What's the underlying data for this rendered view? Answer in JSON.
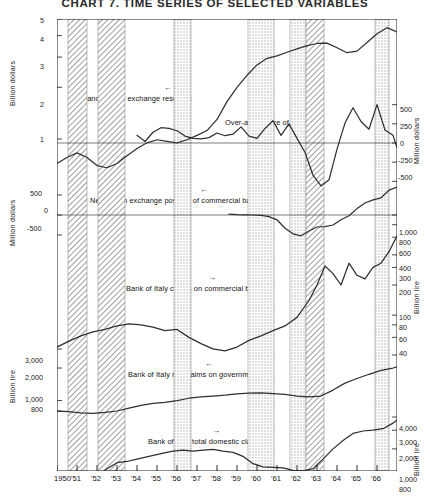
{
  "title": "CHART 7.  TIME SERIES OF SELECTED VARIABLES",
  "chart_data": {
    "type": "line",
    "title": "CHART 7.  TIME SERIES OF SELECTED VARIABLES",
    "subtitle": "Italy, monetary and balance-of-payments variables, 1950-1966",
    "xlabel": "",
    "grid": false,
    "legend_position": "inline-annotations",
    "x_axis": {
      "start_year": 1950,
      "end_year": 1967,
      "tick_labels": [
        "1950",
        "'51",
        "'52",
        "'53",
        "'54",
        "'55",
        "'56",
        "'57",
        "'58",
        "'59",
        "'60",
        "'61",
        "'62",
        "'63",
        "'64",
        "'65",
        "'66"
      ],
      "tick_years": [
        1950,
        1951,
        1952,
        1953,
        1954,
        1955,
        1956,
        1957,
        1958,
        1959,
        1960,
        1961,
        1962,
        1963,
        1964,
        1965,
        1966
      ]
    },
    "shaded_bands": [
      {
        "start": 1950.55,
        "end": 1951.5,
        "pattern": "hatch"
      },
      {
        "start": 1952.05,
        "end": 1953.4,
        "pattern": "hatch"
      },
      {
        "start": 1955.85,
        "end": 1956.7,
        "pattern": "dots"
      },
      {
        "start": 1959.55,
        "end": 1960.85,
        "pattern": "dots"
      },
      {
        "start": 1961.65,
        "end": 1962.45,
        "pattern": "dots"
      },
      {
        "start": 1962.45,
        "end": 1963.35,
        "pattern": "hatch"
      },
      {
        "start": 1965.9,
        "end": 1966.6,
        "pattern": "dots"
      }
    ],
    "panels": [
      {
        "id": "panel-reserves",
        "label": "Gold and foreign exchange reserves",
        "arrow": "left",
        "axis_side": "left",
        "axis_title": "Billion dollars",
        "scale": "log",
        "ticks": [
          "1",
          "2",
          "3",
          "4",
          "5"
        ],
        "tick_values": [
          1,
          2,
          3,
          4,
          5
        ],
        "series": [
          {
            "name": "Gold and foreign exchange reserves",
            "unit": "billion dollars",
            "x": [
              1950.0,
              1950.5,
              1951.0,
              1951.5,
              1952.0,
              1952.5,
              1953.0,
              1953.5,
              1954.0,
              1954.5,
              1955.0,
              1955.5,
              1956.0,
              1956.5,
              1957.0,
              1957.5,
              1958.0,
              1958.5,
              1959.0,
              1959.5,
              1960.0,
              1960.5,
              1961.0,
              1961.5,
              1962.0,
              1962.5,
              1963.0,
              1963.5,
              1964.0,
              1964.5,
              1965.0,
              1965.5,
              1966.0,
              1966.5,
              1967.0
            ],
            "y": [
              0.72,
              0.78,
              0.83,
              0.78,
              0.7,
              0.68,
              0.72,
              0.8,
              0.88,
              0.95,
              0.99,
              0.97,
              0.95,
              0.99,
              1.05,
              1.12,
              1.3,
              1.65,
              2.0,
              2.35,
              2.7,
              2.95,
              3.05,
              3.2,
              3.35,
              3.5,
              3.6,
              3.62,
              3.4,
              3.18,
              3.25,
              3.65,
              4.1,
              4.45,
              4.2
            ]
          }
        ]
      },
      {
        "id": "panel-balance",
        "label": "Over-all balance of payments",
        "arrow": "right",
        "axis_side": "right",
        "axis_title": "Million dollars",
        "scale": "linear",
        "ticks": [
          "500",
          "250",
          "0",
          "-250",
          "-500"
        ],
        "tick_values": [
          500,
          250,
          0,
          -250,
          -500
        ],
        "ylim": [
          -600,
          600
        ],
        "zero_line": true,
        "series": [
          {
            "name": "Over-all balance of payments",
            "unit": "million dollars",
            "x": [
              1954.0,
              1954.4,
              1954.8,
              1955.2,
              1955.6,
              1956.0,
              1956.4,
              1956.8,
              1957.2,
              1957.6,
              1958.0,
              1958.4,
              1958.8,
              1959.2,
              1959.6,
              1960.0,
              1960.4,
              1960.8,
              1961.2,
              1961.6,
              1962.0,
              1962.4,
              1962.8,
              1963.2,
              1963.6,
              1964.0,
              1964.4,
              1964.8,
              1965.2,
              1965.6,
              1966.0,
              1966.4,
              1966.8,
              1967.0
            ],
            "y": [
              100,
              20,
              140,
              200,
              190,
              160,
              90,
              60,
              55,
              70,
              130,
              95,
              115,
              210,
              90,
              60,
              190,
              290,
              100,
              250,
              60,
              -120,
              -420,
              -560,
              -480,
              -80,
              260,
              460,
              280,
              180,
              500,
              170,
              100,
              -60
            ]
          }
        ]
      },
      {
        "id": "panel-netfx",
        "label": "Net foreign exchange position of commercial banks",
        "arrow": "left",
        "axis_side": "left",
        "axis_title": "Million dollars",
        "scale": "linear",
        "ticks": [
          "500",
          "0",
          "-500"
        ],
        "tick_values": [
          500,
          0,
          -500
        ],
        "ylim": [
          -900,
          900
        ],
        "zero_line": true,
        "series": [
          {
            "name": "Net foreign exchange position of commercial banks",
            "unit": "million dollars",
            "x": [
              1958.6,
              1959.0,
              1959.4,
              1959.8,
              1960.2,
              1960.6,
              1961.0,
              1961.4,
              1961.8,
              1962.2,
              1962.6,
              1963.0,
              1963.4,
              1963.8,
              1964.2,
              1964.6,
              1965.0,
              1965.4,
              1965.8,
              1966.2,
              1966.6,
              1967.0
            ],
            "y": [
              20,
              10,
              5,
              0,
              -10,
              -40,
              -120,
              -330,
              -470,
              -520,
              -400,
              -300,
              -290,
              -250,
              -120,
              -20,
              160,
              300,
              380,
              430,
              620,
              700
            ]
          }
        ]
      },
      {
        "id": "panel-boiclaims",
        "label": "Bank of Italy claims on commercial banks",
        "arrow": "right",
        "axis_side": "right",
        "axis_title": "Billion lire",
        "scale": "log",
        "ticks": [
          "1,000",
          "800",
          "600",
          "400",
          "300",
          "200",
          "100",
          "80",
          "60",
          "40"
        ],
        "tick_values": [
          1000,
          800,
          600,
          400,
          300,
          200,
          100,
          80,
          60,
          40
        ],
        "series": [
          {
            "name": "Bank of Italy claims on commercial banks",
            "unit": "billion lire",
            "x": [
              1950.0,
              1950.6,
              1951.2,
              1951.8,
              1952.4,
              1953.0,
              1953.6,
              1954.2,
              1954.8,
              1955.4,
              1956.0,
              1956.6,
              1957.2,
              1957.8,
              1958.4,
              1959.0,
              1959.6,
              1960.2,
              1960.8,
              1961.4,
              1962.0,
              1962.6,
              1963.0,
              1963.4,
              1963.8,
              1964.2,
              1964.6,
              1965.0,
              1965.4,
              1965.8,
              1966.2,
              1966.6,
              1967.0
            ],
            "y": [
              48,
              55,
              62,
              68,
              72,
              78,
              82,
              80,
              76,
              70,
              72,
              60,
              52,
              46,
              44,
              48,
              56,
              62,
              70,
              78,
              95,
              140,
              200,
              310,
              260,
              200,
              330,
              250,
              230,
              300,
              330,
              430,
              620
            ]
          }
        ]
      },
      {
        "id": "panel-govt",
        "label": "Bank of Italy net claims on government",
        "arrow": "left",
        "axis_side": "left",
        "axis_title": "Billion lire",
        "scale": "log",
        "ticks": [
          "3,000",
          "2,000",
          "1,000",
          "800"
        ],
        "tick_values": [
          3000,
          2000,
          1000,
          800
        ],
        "series": [
          {
            "name": "Bank of Italy net claims on government",
            "unit": "billion lire",
            "x": [
              1950.0,
              1950.6,
              1951.2,
              1951.8,
              1952.4,
              1953.0,
              1953.6,
              1954.2,
              1954.8,
              1955.4,
              1956.0,
              1956.6,
              1957.2,
              1957.8,
              1958.4,
              1959.0,
              1959.6,
              1960.2,
              1960.8,
              1961.4,
              1962.0,
              1962.6,
              1963.2,
              1963.8,
              1964.4,
              1965.0,
              1965.6,
              1966.2,
              1966.8,
              1967.0
            ],
            "y": [
              800,
              790,
              770,
              760,
              775,
              800,
              850,
              900,
              940,
              960,
              1000,
              1050,
              1080,
              1100,
              1120,
              1150,
              1170,
              1180,
              1160,
              1140,
              1100,
              1080,
              1100,
              1250,
              1450,
              1600,
              1750,
              1900,
              2000,
              2050
            ]
          }
        ]
      },
      {
        "id": "panel-domestic",
        "label": "Bank of Italy total domestic claims",
        "arrow": "right",
        "axis_side": "right",
        "axis_title": "Billion lire",
        "scale": "log",
        "ticks": [
          "4,000",
          "3,000",
          "2,000",
          "1,000",
          "800"
        ],
        "tick_values": [
          4000,
          3000,
          2000,
          1000,
          800
        ],
        "series": [
          {
            "name": "Bank of Italy total domestic claims",
            "unit": "billion lire",
            "x": [
              1950.0,
              1950.4,
              1950.8,
              1951.2,
              1951.6,
              1952.0,
              1952.5,
              1953.0,
              1953.5,
              1954.0,
              1954.6,
              1955.2,
              1955.8,
              1956.3,
              1956.8,
              1957.3,
              1957.8,
              1958.3,
              1958.8,
              1959.3,
              1959.8,
              1960.3,
              1960.8,
              1961.3,
              1961.8,
              1962.3,
              1962.8,
              1963.3,
              1963.8,
              1964.3,
              1964.8,
              1965.3,
              1965.8,
              1966.3,
              1966.8,
              1967.0
            ],
            "y": [
              920,
              880,
              860,
              900,
              980,
              1100,
              1300,
              1480,
              1520,
              1600,
              1700,
              1800,
              1900,
              1950,
              1900,
              1950,
              1980,
              1900,
              1850,
              1700,
              1450,
              1350,
              1340,
              1320,
              1250,
              1240,
              1300,
              1600,
              2000,
              2400,
              2800,
              2950,
              3000,
              3100,
              3500,
              3750
            ]
          }
        ]
      }
    ]
  },
  "colors": {
    "line": "#303030",
    "axis": "#1a1a1a",
    "band_hatch": "#8e8e8e",
    "band_dots": "#b5b5b5",
    "background": "#ffffff"
  }
}
